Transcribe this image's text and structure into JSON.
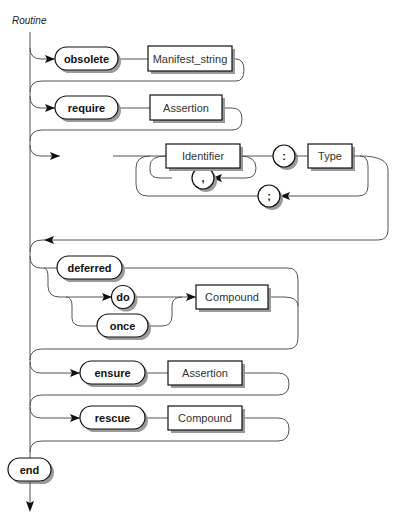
{
  "diagram": {
    "title": "Routine",
    "type": "syntax-railroad-diagram",
    "rows": {
      "obsolete": {
        "keyword": "obsolete",
        "nonterminal": "Manifest_string",
        "optional": true
      },
      "require": {
        "keyword": "require",
        "nonterminal": "Assertion",
        "optional": true
      },
      "local": {
        "keyword": "local",
        "identifier": "Identifier",
        "comma": ",",
        "colon": ":",
        "type": "Type",
        "semicolon": ";",
        "optional": true
      },
      "body": {
        "deferred": "deferred",
        "do": "do",
        "once": "once",
        "compound": "Compound"
      },
      "ensure": {
        "keyword": "ensure",
        "nonterminal": "Assertion",
        "optional": true
      },
      "rescue": {
        "keyword": "rescue",
        "nonterminal": "Compound",
        "optional": true
      },
      "end": {
        "keyword": "end"
      }
    }
  }
}
